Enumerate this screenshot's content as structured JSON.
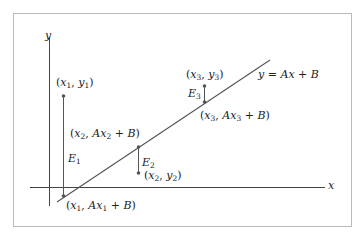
{
  "diagram": {
    "axes": {
      "x_label": "x",
      "y_label": "y"
    },
    "line_label": "y = Ax + B",
    "points": [
      {
        "data_label": "(x1, y1)",
        "line_label": "(x1, Ax1 + B)",
        "error_label": "E1"
      },
      {
        "data_label": "(x2, y2)",
        "line_label": "(x2, Ax2 + B)",
        "error_label": "E2"
      },
      {
        "data_label": "(x3, y3)",
        "line_label": "(x3, Ax3 + B)",
        "error_label": "E3"
      }
    ],
    "colors": {
      "frame": "#bbbbbb",
      "axes": "#444444",
      "line": "#555555",
      "text": "#222222"
    }
  }
}
